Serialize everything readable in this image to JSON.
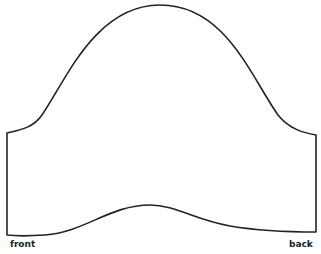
{
  "diagram": {
    "type": "sewing-pattern-piece",
    "shape": "sleeve",
    "stroke_color": "#222222",
    "background": "#ffffff",
    "labels": {
      "front": "front",
      "back": "back"
    }
  }
}
